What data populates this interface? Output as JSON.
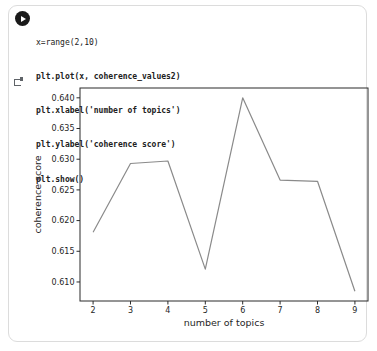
{
  "cell": {
    "run_button": "run",
    "code": {
      "lines": [
        "x=range(2,10)",
        "plt.plot(x, coherence_values2)",
        "plt.xlabel('number of topics')",
        "plt.ylabel('coherence score')",
        "plt.show()"
      ]
    }
  },
  "chart_data": {
    "type": "line",
    "title": "",
    "xlabel": "number of topics",
    "ylabel": "coherence score",
    "series": [
      {
        "name": "coherence_values2",
        "x": [
          2,
          3,
          4,
          5,
          6,
          7,
          8,
          9
        ],
        "y": [
          0.6181,
          0.6293,
          0.6297,
          0.6121,
          0.64,
          0.6266,
          0.6264,
          0.6085
        ]
      }
    ],
    "xticks": [
      2,
      3,
      4,
      5,
      6,
      7,
      8,
      9
    ],
    "yticks": [
      0.61,
      0.615,
      0.62,
      0.625,
      0.63,
      0.635,
      0.64
    ],
    "xlim": [
      1.65,
      9.35
    ],
    "ylim": [
      0.6069,
      0.6416
    ],
    "grid": false,
    "legend": null,
    "line_color": "#8a8a8a",
    "axis_color": "#2b2b2b",
    "text_color": "#262626"
  }
}
